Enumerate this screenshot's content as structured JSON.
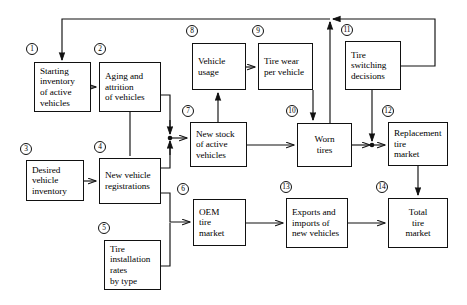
{
  "diagram": {
    "stroke_color": "#111111",
    "background_color": "#ffffff",
    "nodes": [
      {
        "id": 1,
        "tag": "1",
        "label": "Starting\ninventory\nof active\nvehicles",
        "x": 34,
        "y": 62,
        "w": 57,
        "h": 50,
        "align": "left",
        "tag_x": 26,
        "tag_y": 43
      },
      {
        "id": 2,
        "tag": "2",
        "label": "Aging and\nattrition\nof vehicles",
        "x": 99,
        "y": 62,
        "w": 62,
        "h": 50,
        "align": "left",
        "tag_x": 94,
        "tag_y": 43
      },
      {
        "id": 3,
        "tag": "3",
        "label": "Desired\nvehicle\ninventory",
        "x": 26,
        "y": 160,
        "w": 58,
        "h": 41,
        "align": "left",
        "tag_x": 20,
        "tag_y": 143
      },
      {
        "id": 4,
        "tag": "4",
        "label": "New vehicle\nregistrations",
        "x": 99,
        "y": 158,
        "w": 62,
        "h": 46,
        "align": "left",
        "tag_x": 94,
        "tag_y": 141
      },
      {
        "id": 5,
        "tag": "5",
        "label": "Tire\ninstallation\nrates\nby type",
        "x": 104,
        "y": 240,
        "w": 57,
        "h": 50,
        "align": "left",
        "tag_x": 98,
        "tag_y": 222
      },
      {
        "id": 6,
        "tag": "6",
        "label": "OEM\ntire\nmarket",
        "x": 193,
        "y": 199,
        "w": 53,
        "h": 47,
        "align": "left",
        "tag_x": 177,
        "tag_y": 183
      },
      {
        "id": 7,
        "tag": "7",
        "label": "New stock\nof active\nvehicles",
        "x": 190,
        "y": 122,
        "w": 57,
        "h": 45,
        "align": "left",
        "tag_x": 182,
        "tag_y": 105
      },
      {
        "id": 8,
        "tag": "8",
        "label": "Vehicle\nusage",
        "x": 192,
        "y": 43,
        "w": 54,
        "h": 47,
        "align": "left",
        "tag_x": 186,
        "tag_y": 25
      },
      {
        "id": 9,
        "tag": "9",
        "label": "Tire wear\nper vehicle",
        "x": 258,
        "y": 43,
        "w": 55,
        "h": 47,
        "align": "left",
        "tag_x": 252,
        "tag_y": 25
      },
      {
        "id": 10,
        "tag": "10",
        "label": "Worn\ntires",
        "x": 297,
        "y": 123,
        "w": 55,
        "h": 44,
        "align": "center",
        "tag_x": 286,
        "tag_y": 105
      },
      {
        "id": 11,
        "tag": "11",
        "label": "Tire\nswitching\ndecisions",
        "x": 345,
        "y": 41,
        "w": 56,
        "h": 49,
        "align": "left",
        "tag_x": 341,
        "tag_y": 24
      },
      {
        "id": 12,
        "tag": "12",
        "label": "Replacement\ntire\nmarket",
        "x": 388,
        "y": 122,
        "w": 60,
        "h": 44,
        "align": "left",
        "tag_x": 382,
        "tag_y": 105
      },
      {
        "id": 13,
        "tag": "13",
        "label": "Exports and\nimports of\nnew vehicles",
        "x": 286,
        "y": 198,
        "w": 62,
        "h": 50,
        "align": "left",
        "tag_x": 280,
        "tag_y": 181
      },
      {
        "id": 14,
        "tag": "14",
        "label": "Total\ntire\nmarket",
        "x": 388,
        "y": 198,
        "w": 60,
        "h": 50,
        "align": "center",
        "tag_x": 376,
        "tag_y": 181
      }
    ],
    "connections": [
      {
        "from": "feedback-junction",
        "to": "1",
        "desc": "top feedback loop into starting inventory"
      },
      {
        "from": "1",
        "to": "2",
        "desc": "starting inventory to aging and attrition"
      },
      {
        "from": "2",
        "to": "7",
        "desc": "aging and attrition to new stock of active vehicles"
      },
      {
        "from": "3",
        "to": "4",
        "desc": "desired vehicle inventory to new vehicle registrations"
      },
      {
        "from": "2",
        "to": "4",
        "desc": "aging and attrition down to new vehicle registrations"
      },
      {
        "from": "4",
        "to": "7",
        "desc": "new vehicle registrations to new stock of active vehicles"
      },
      {
        "from": "4",
        "to": "6",
        "desc": "new vehicle registrations to OEM tire market"
      },
      {
        "from": "5",
        "to": "6",
        "desc": "tire installation rates to OEM tire market"
      },
      {
        "from": "7",
        "to": "8",
        "desc": "new stock of active vehicles to vehicle usage"
      },
      {
        "from": "8",
        "to": "9",
        "desc": "vehicle usage to tire wear per vehicle"
      },
      {
        "from": "9",
        "to": "10",
        "desc": "tire wear per vehicle to worn tires"
      },
      {
        "from": "7",
        "to": "10",
        "desc": "new stock of active vehicles to worn tires"
      },
      {
        "from": "10",
        "to": "12",
        "desc": "worn tires to replacement tire market"
      },
      {
        "from": "11",
        "to": "12",
        "desc": "tire switching decisions to replacement tire market"
      },
      {
        "from": "11",
        "to": "feedback-junction",
        "desc": "tire switching decisions up to feedback junction"
      },
      {
        "from": "10",
        "to": "feedback-junction",
        "desc": "worn tires up to feedback junction"
      },
      {
        "from": "6",
        "to": "13",
        "desc": "OEM tire market to exports and imports of new vehicles"
      },
      {
        "from": "13",
        "to": "14",
        "desc": "exports and imports to total tire market"
      },
      {
        "from": "12",
        "to": "14",
        "desc": "replacement tire market to total tire market"
      }
    ]
  }
}
